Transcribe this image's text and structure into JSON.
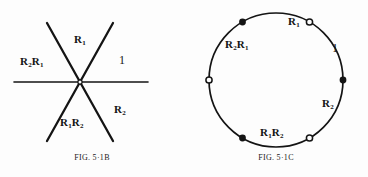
{
  "page": {
    "background_color": "#fdfdfd",
    "ink_color": "#141414",
    "width": 368,
    "height": 177
  },
  "figures": [
    {
      "id": "fig-5-1b",
      "type": "line-diagram",
      "caption": {
        "prefix": "F",
        "prefix_rest": "IG",
        "punct": ". 5",
        "middot": "·",
        "number": "1",
        "letter": "B",
        "full": "FIG. 5·1B"
      },
      "description": "Six rays radiating from a common center point, dividing the plane into six sectors labeled with group elements.",
      "center": {
        "x": 80,
        "y": 82
      },
      "rays": [
        {
          "name": "ray-horizontal-left",
          "angle_deg": 180
        },
        {
          "name": "ray-horizontal-right",
          "angle_deg": 0
        },
        {
          "name": "ray-upper-left",
          "angle_deg": 120
        },
        {
          "name": "ray-upper-right",
          "angle_deg": 60
        },
        {
          "name": "ray-lower-left",
          "angle_deg": 240
        },
        {
          "name": "ray-lower-right",
          "angle_deg": 300
        }
      ],
      "sector_labels": [
        {
          "name": "sector-label-r1",
          "base": "R",
          "sub": "1",
          "suffix": "",
          "suffix_sub": "",
          "x": 74,
          "y": 34
        },
        {
          "name": "sector-label-r2r1",
          "base": "R",
          "sub": "2",
          "suffix": "R",
          "suffix_sub": "1",
          "x": 20,
          "y": 56
        },
        {
          "name": "sector-label-identity",
          "base": "1",
          "sub": "",
          "suffix": "",
          "suffix_sub": "",
          "x": 119,
          "y": 55
        },
        {
          "name": "sector-label-r2",
          "base": "R",
          "sub": "2",
          "suffix": "",
          "suffix_sub": "",
          "x": 114,
          "y": 104
        },
        {
          "name": "sector-label-r1r2",
          "base": "R",
          "sub": "1",
          "suffix": "R",
          "suffix_sub": "2",
          "x": 60,
          "y": 117
        }
      ]
    },
    {
      "id": "fig-5-1c",
      "type": "circle-diagram",
      "caption": {
        "full": "FIG. 5·1C"
      },
      "description": "A circle with six marked points alternating between filled and open, labeled with group elements around the circumference.",
      "circle": {
        "cx": 92,
        "cy": 80,
        "r": 67
      },
      "vertices": [
        {
          "name": "vertex-top-left",
          "fill": "solid",
          "angle_deg": 120
        },
        {
          "name": "vertex-top-right",
          "fill": "open",
          "angle_deg": 60
        },
        {
          "name": "vertex-right",
          "fill": "solid",
          "angle_deg": 0
        },
        {
          "name": "vertex-bottom-right",
          "fill": "open",
          "angle_deg": 300
        },
        {
          "name": "vertex-bottom-left",
          "fill": "solid",
          "angle_deg": 240
        },
        {
          "name": "vertex-left",
          "fill": "open",
          "angle_deg": 180
        }
      ],
      "arc_labels": [
        {
          "name": "arc-label-r1",
          "base": "R",
          "sub": "1",
          "suffix": "",
          "suffix_sub": "",
          "x": 108,
          "y": 18
        },
        {
          "name": "arc-label-r2r1",
          "base": "R",
          "sub": "2",
          "suffix": "R",
          "suffix_sub": "1",
          "x": 41,
          "y": 40
        },
        {
          "name": "arc-label-identity",
          "base": "1",
          "sub": "",
          "suffix": "",
          "suffix_sub": "",
          "x": 148,
          "y": 44
        },
        {
          "name": "arc-label-r2",
          "base": "R",
          "sub": "2",
          "suffix": "",
          "suffix_sub": "",
          "x": 139,
          "y": 99
        },
        {
          "name": "arc-label-r1r2",
          "base": "R",
          "sub": "1",
          "suffix": "R",
          "suffix_sub": "2",
          "x": 77,
          "y": 130
        }
      ]
    }
  ]
}
